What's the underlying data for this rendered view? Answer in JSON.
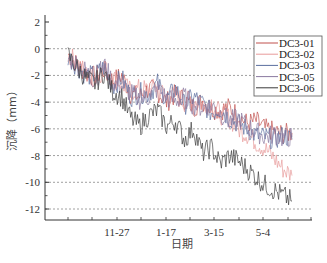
{
  "chart_data": {
    "type": "line",
    "title": "",
    "xlabel": "日期",
    "ylabel": "沉降（mm）",
    "ylim": [
      -13,
      2
    ],
    "yticks": [
      2,
      0,
      -2,
      -4,
      -6,
      -8,
      -10,
      -12
    ],
    "xtick_labels": [
      "11-27",
      "1-17",
      "3-15",
      "5-4"
    ],
    "grid": "horizontal dotted at each major y tick",
    "legend_position": "upper right",
    "x": [
      0,
      1,
      2,
      3,
      4,
      5,
      6,
      7,
      8,
      9,
      10,
      11,
      12,
      13,
      14,
      15,
      16,
      17,
      18,
      19,
      20,
      21,
      22,
      23,
      24,
      25
    ],
    "x_note": "index over monitoring period; 11-27 ≈ index 5.5, 1-17 ≈ 10, 3-15 ≈ 14.5, 5-4 ≈ 19.5",
    "series": [
      {
        "name": "DC3-01",
        "color": "#c0504d",
        "values": [
          -0.4,
          -1.2,
          -1.8,
          -2.1,
          -1.6,
          -2.4,
          -2.0,
          -3.4,
          -3.6,
          -3.0,
          -3.2,
          -4.0,
          -3.4,
          -3.8,
          -4.4,
          -3.9,
          -4.5,
          -4.6,
          -4.4,
          -5.0,
          -5.6,
          -5.4,
          -6.0,
          -6.2,
          -6.4,
          -6.3
        ]
      },
      {
        "name": "DC3-02",
        "color": "#e89a9a",
        "values": [
          -0.5,
          -1.0,
          -1.9,
          -2.3,
          -1.5,
          -2.2,
          -2.6,
          -3.2,
          -3.0,
          -3.1,
          -2.9,
          -3.6,
          -3.5,
          -4.0,
          -3.8,
          -4.2,
          -4.0,
          -4.9,
          -5.2,
          -6.0,
          -6.4,
          -7.0,
          -7.5,
          -8.2,
          -9.0,
          -9.5
        ]
      },
      {
        "name": "DC3-03",
        "color": "#5a6e9e",
        "values": [
          -0.6,
          -1.3,
          -2.0,
          -2.0,
          -1.4,
          -2.8,
          -2.2,
          -3.6,
          -3.3,
          -3.4,
          -2.6,
          -3.8,
          -3.0,
          -4.2,
          -3.6,
          -4.1,
          -4.8,
          -4.5,
          -5.2,
          -5.6,
          -6.0,
          -6.5,
          -6.6,
          -6.8,
          -6.5,
          -6.8
        ]
      },
      {
        "name": "DC3-05",
        "color": "#8a7aa0",
        "values": [
          -0.7,
          -1.1,
          -1.7,
          -2.4,
          -1.2,
          -2.5,
          -2.8,
          -3.3,
          -3.8,
          -3.6,
          -3.0,
          -3.7,
          -3.9,
          -3.6,
          -4.2,
          -4.4,
          -4.2,
          -4.8,
          -5.4,
          -5.2,
          -5.8,
          -6.2,
          -6.6,
          -6.4,
          -6.7,
          -6.6
        ]
      },
      {
        "name": "DC3-06",
        "color": "#3a3a3a",
        "values": [
          -0.5,
          -1.4,
          -2.2,
          -2.6,
          -1.8,
          -3.2,
          -3.6,
          -5.2,
          -5.8,
          -5.0,
          -4.6,
          -5.8,
          -5.4,
          -6.8,
          -6.0,
          -7.8,
          -7.4,
          -8.6,
          -8.0,
          -8.4,
          -9.0,
          -9.6,
          -10.2,
          -10.6,
          -11.0,
          -11.4
        ]
      }
    ]
  },
  "legend": {
    "items": [
      "DC3-01",
      "DC3-02",
      "DC3-03",
      "DC3-05",
      "DC3-06"
    ]
  },
  "axes": {
    "xlabel": "日期",
    "ylabel": "沉降（mm）"
  }
}
